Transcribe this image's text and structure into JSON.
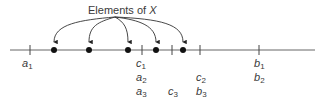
{
  "title": {
    "text": "Elements of ",
    "var": "X"
  },
  "colors": {
    "line": "#555555",
    "dot": "#111111",
    "text": "#3a3a3a"
  },
  "number_line": {
    "y": 50,
    "x_start": 10,
    "x_end": 315
  },
  "elements_of_x": [
    {
      "x": 54
    },
    {
      "x": 89
    },
    {
      "x": 128
    },
    {
      "x": 156
    },
    {
      "x": 183
    }
  ],
  "ticks": [
    {
      "x": 30,
      "labels": [
        {
          "base": "a",
          "sub": "1"
        }
      ]
    },
    {
      "x": 142,
      "labels": [
        {
          "base": "c",
          "sub": "1"
        },
        {
          "base": "a",
          "sub": "2"
        },
        {
          "base": "a",
          "sub": "3"
        }
      ]
    },
    {
      "x": 172,
      "labels": [
        {
          "base": "c",
          "sub": "3",
          "row": 2
        }
      ]
    },
    {
      "x": 200,
      "labels": [
        {
          "base": "c",
          "sub": "2",
          "row": 1
        },
        {
          "base": "b",
          "sub": "3",
          "row": 2
        }
      ]
    },
    {
      "x": 259,
      "labels": [
        {
          "base": "b",
          "sub": "1"
        },
        {
          "base": "b",
          "sub": "2"
        }
      ]
    }
  ],
  "labels": {
    "a1": {
      "base": "a",
      "sub": "1"
    },
    "c1": {
      "base": "c",
      "sub": "1"
    },
    "a2": {
      "base": "a",
      "sub": "2"
    },
    "a3": {
      "base": "a",
      "sub": "3"
    },
    "c3": {
      "base": "c",
      "sub": "3"
    },
    "c2": {
      "base": "c",
      "sub": "2"
    },
    "b3": {
      "base": "b",
      "sub": "3"
    },
    "b1": {
      "base": "b",
      "sub": "1"
    },
    "b2": {
      "base": "b",
      "sub": "2"
    }
  }
}
